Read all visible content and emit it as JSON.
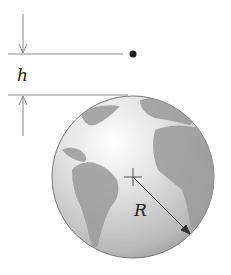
{
  "diagram": {
    "labels": {
      "height": "h",
      "radius": "R"
    },
    "elements": [
      "satellite-point",
      "earth-sphere",
      "center-cross",
      "radius-arrow",
      "height-dimension"
    ],
    "colors": {
      "line": "#8a8a8a",
      "dot": "#222222",
      "ocean": "#d8d8d8",
      "land": "#9a9a9a"
    }
  }
}
